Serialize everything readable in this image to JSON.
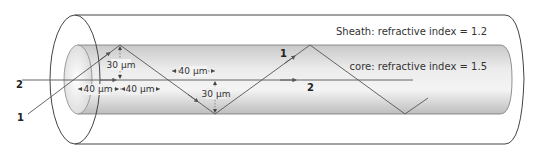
{
  "diagram": {
    "sheath_label": "Sheath: refractive index = 1.2",
    "core_label": "core: refractive index = 1.5",
    "ray_labels": {
      "ray1_start": "1",
      "ray1_mid": "1",
      "ray2_start": "2",
      "ray2_mid": "2"
    },
    "dimensions": {
      "height_left": "30 µm",
      "height_mid": "30 µm",
      "width_left_a": "40 µm",
      "width_left_b": "40 µm",
      "width_top": "40 µm"
    },
    "colors": {
      "outline": "#444444",
      "core_fill_light": "#f2f2f2",
      "core_fill_dark": "#c8c8c8",
      "ray": "#555555"
    }
  }
}
